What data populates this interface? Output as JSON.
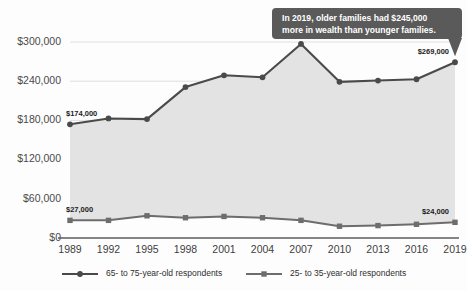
{
  "chart_data": {
    "type": "line",
    "title": "",
    "subtitle": "",
    "xlabel": "",
    "ylabel": "",
    "grid": true,
    "legend_position": "bottom",
    "categories": [
      "1989",
      "1992",
      "1995",
      "1998",
      "2001",
      "2004",
      "2007",
      "2010",
      "2013",
      "2016",
      "2019"
    ],
    "x": [
      1989,
      1992,
      1995,
      1998,
      2001,
      2004,
      2007,
      2010,
      2013,
      2016,
      2019
    ],
    "ylim": [
      0,
      300000
    ],
    "yticks": [
      0,
      60000,
      120000,
      180000,
      240000,
      300000
    ],
    "ytick_labels": [
      "$0",
      "$60,000",
      "$120,000",
      "$180,000",
      "$240,000",
      "$300,000"
    ],
    "series": [
      {
        "name": "65- to 75-year-old respondents",
        "marker": "circle",
        "color": "#4a4a4a",
        "values": [
          174000,
          183000,
          182000,
          231000,
          249000,
          246000,
          297000,
          239000,
          241000,
          243000,
          269000
        ]
      },
      {
        "name": "25- to 35-year-old respondents",
        "marker": "square",
        "color": "#6d6d6d",
        "values": [
          27000,
          27000,
          34000,
          31000,
          33000,
          31000,
          27000,
          18000,
          19000,
          21000,
          24000
        ]
      }
    ],
    "point_labels": [
      {
        "series": 0,
        "index": 0,
        "text": "$174,000"
      },
      {
        "series": 0,
        "index": 10,
        "text": "$269,000"
      },
      {
        "series": 1,
        "index": 0,
        "text": "$27,000"
      },
      {
        "series": 1,
        "index": 10,
        "text": "$24,000"
      }
    ],
    "annotations": [
      {
        "id": "callout-2019",
        "line1": "In 2019, older families had $245,000",
        "line2": "more in wealth than younger families.",
        "background": "#5a5a5a",
        "text_color": "#ffffff",
        "points_to": "2019"
      }
    ],
    "band": {
      "description": "shaded region between the two series",
      "color": "#e3e3e3"
    }
  },
  "legend": {
    "items": [
      {
        "label": "65- to 75-year-old respondents",
        "marker": "circle",
        "color": "#4a4a4a"
      },
      {
        "label": "25- to 35-year-old respondents",
        "marker": "square",
        "color": "#6d6d6d"
      }
    ]
  },
  "colors": {
    "background": "#fdfdfd",
    "grid": "#d8d8d8",
    "axis": "#5b5b5b",
    "band": "#e3e3e3",
    "series_old": "#4a4a4a",
    "series_young": "#6d6d6d",
    "callout_bg": "#5a5a5a",
    "callout_text": "#ffffff"
  }
}
